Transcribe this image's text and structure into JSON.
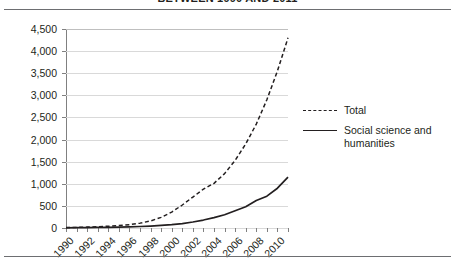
{
  "title": "BETWEEN 1990 AND 2011",
  "rules": {
    "top": "horizontal-rule",
    "bottom": "horizontal-rule"
  },
  "chart_data": {
    "type": "line",
    "title": "BETWEEN 1990 AND 2011",
    "xlabel": "",
    "ylabel": "",
    "xlim": [
      1990,
      2011
    ],
    "ylim": [
      0,
      4500
    ],
    "grid": true,
    "legend_position": "right",
    "ytick_labels": [
      "4,500",
      "4,000",
      "3,500",
      "3,000",
      "2,500",
      "2,000",
      "1,500",
      "1,000",
      "500",
      "0"
    ],
    "ytick_values": [
      4500,
      4000,
      3500,
      3000,
      2500,
      2000,
      1500,
      1000,
      500,
      0
    ],
    "xtick_labels": [
      "1990",
      "1992",
      "1994",
      "1996",
      "1998",
      "2000",
      "2002",
      "2004",
      "2006",
      "2008",
      "2010"
    ],
    "xtick_values": [
      1990,
      1992,
      1994,
      1996,
      1998,
      2000,
      2002,
      2004,
      2006,
      2008,
      2010
    ],
    "x": [
      1990,
      1991,
      1992,
      1993,
      1994,
      1995,
      1996,
      1997,
      1998,
      1999,
      2000,
      2001,
      2002,
      2003,
      2004,
      2005,
      2006,
      2007,
      2008,
      2009,
      2010,
      2011
    ],
    "series": [
      {
        "name": "Total",
        "style": "dashed",
        "values": [
          10,
          14,
          20,
          28,
          40,
          55,
          75,
          110,
          160,
          240,
          360,
          520,
          700,
          880,
          1010,
          1230,
          1530,
          1900,
          2350,
          2900,
          3550,
          4300
        ]
      },
      {
        "name": "Social science and humanities",
        "style": "solid",
        "values": [
          5,
          7,
          9,
          12,
          16,
          20,
          26,
          34,
          44,
          58,
          76,
          100,
          135,
          180,
          235,
          300,
          390,
          480,
          620,
          720,
          900,
          1150
        ]
      }
    ]
  },
  "legend": {
    "items": [
      {
        "label": "Total",
        "style": "dashed"
      },
      {
        "label": "Social science and humanities",
        "style": "solid"
      }
    ]
  }
}
